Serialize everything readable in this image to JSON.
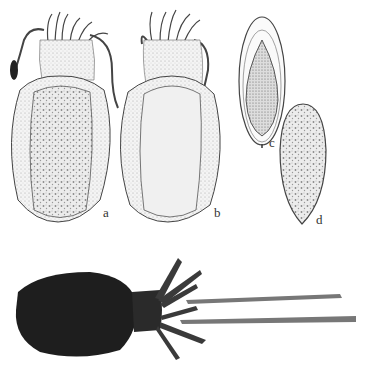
{
  "figure": {
    "panels": [
      {
        "id": "a",
        "label": "a",
        "description": "cuttlefish dorsal view drawing with mottled mantle"
      },
      {
        "id": "b",
        "label": "b",
        "description": "cuttlefish dorsal view drawing with stippled mantle"
      },
      {
        "id": "c",
        "label": "c",
        "description": "cuttlebone ventral view drawing"
      },
      {
        "id": "d",
        "label": "d",
        "description": "cuttlebone dorsal view drawing"
      },
      {
        "id": "photo",
        "label": "",
        "description": "photograph of preserved cuttlefish specimen"
      }
    ]
  }
}
